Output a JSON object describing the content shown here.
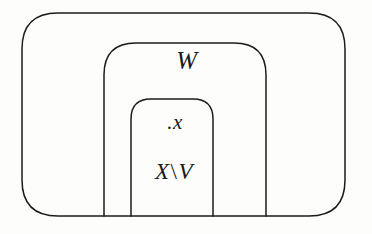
{
  "figure": {
    "kind": "nested-set-diagram",
    "background_color": "#fdfdfc",
    "stroke_color": "#1b1b1b",
    "regions": [
      {
        "name": "outer-region",
        "label": "",
        "shape": "rounded-rectangle",
        "x": 22,
        "y": 13,
        "width": 323,
        "height": 203,
        "corner_radius": 36
      },
      {
        "name": "middle-region",
        "label": "W",
        "shape": "open-bottom-arch",
        "x": 104,
        "y": 43,
        "width": 162,
        "height": 173,
        "corner_radius": 32
      },
      {
        "name": "inner-region",
        "label": "X \\ V",
        "shape": "open-bottom-arch",
        "x": 131,
        "y": 99,
        "width": 82,
        "height": 117,
        "corner_radius": 20
      }
    ],
    "points": [
      {
        "name": "point-x",
        "label": "x",
        "marker": ".",
        "x": 166,
        "y": 126
      }
    ]
  },
  "labels": {
    "middle_region": "W",
    "point_marker": ".",
    "point_name": "x",
    "inner_region_left": "X",
    "inner_region_separator": "\\",
    "inner_region_right": "V"
  }
}
